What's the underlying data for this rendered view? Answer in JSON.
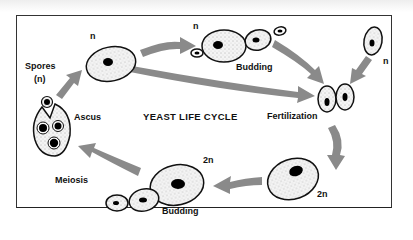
{
  "diagram": {
    "title": "YEAST LIFE CYCLE",
    "labels": {
      "spores": "Spores",
      "spores_ploidy": "(n)",
      "ascus": "Ascus",
      "haploid_top": "n",
      "haploid_budding_top": "n",
      "budding_top": "Budding",
      "haploid_right": "n",
      "fertilization": "Fertilization",
      "diploid_right": "2n",
      "diploid_bottom": "2n",
      "budding_bottom": "Budding",
      "meiosis": "Meiosis"
    },
    "colors": {
      "arrow": "#8a8a8a",
      "cell_outline": "#111111",
      "nucleus": "#000000",
      "frame": "#333333"
    }
  }
}
